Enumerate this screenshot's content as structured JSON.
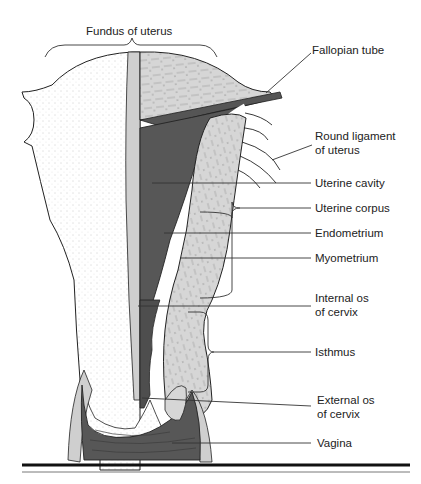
{
  "diagram": {
    "colors": {
      "background": "#ffffff",
      "dark_tissue": "#555555",
      "light_tissue": "#d4d4d4",
      "mid_tissue": "#bdbdbd",
      "stipple_surface": "#f4f4f4",
      "outline": "#222222"
    },
    "labels": {
      "fundus": "Fundus of uterus",
      "fallopian_tube": "Fallopian tube",
      "round_ligament_line1": "Round ligament",
      "round_ligament_line2": "of uterus",
      "uterine_cavity": "Uterine cavity",
      "uterine_corpus": "Uterine corpus",
      "endometrium": "Endometrium",
      "myometrium": "Myometrium",
      "internal_os_line1": "Internal os",
      "internal_os_line2": "of cervix",
      "isthmus": "Isthmus",
      "external_os_line1": "External os",
      "external_os_line2": "of cervix",
      "vagina": "Vagina"
    }
  }
}
